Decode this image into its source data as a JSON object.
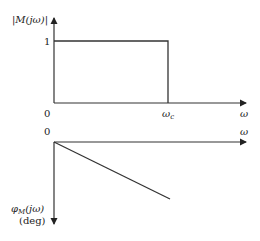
{
  "diagram": {
    "type": "ideal-filter-frequency-response",
    "colors": {
      "line": "#333333",
      "text": "#222222",
      "background": "#ffffff"
    },
    "magnitude_plot": {
      "y_axis_label": "|M(jω)|",
      "y_tick_one": "1",
      "origin_label": "0",
      "x_axis_label": "ω",
      "cutoff_label": "ω",
      "cutoff_subscript": "c",
      "description": "Magnitude equals 1 from 0 to cutoff frequency ωc, then drops to 0"
    },
    "phase_plot": {
      "origin_label": "0",
      "x_axis_label": "ω",
      "y_axis_label_main": "φ",
      "y_axis_label_sub": "M",
      "y_axis_label_tail": "(jω)",
      "y_axis_unit": "(deg)",
      "description": "Phase decreases linearly from 0 with increasing ω (downward pointing y-axis)"
    }
  }
}
